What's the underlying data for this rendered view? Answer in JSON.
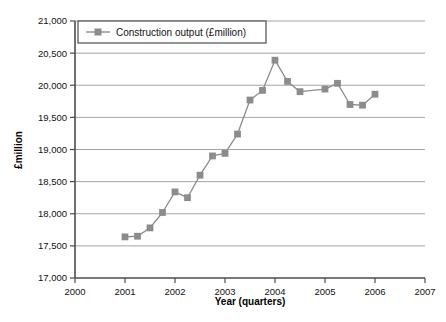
{
  "chart_data": {
    "type": "line",
    "title": "",
    "subtitle": "",
    "xlabel": "Year (quarters)",
    "ylabel": "£million",
    "xlim": [
      2000,
      2007
    ],
    "ylim": [
      17000,
      21000
    ],
    "grid": true,
    "grid_axis": "y",
    "legend_position": "top-left-inside",
    "series": [
      {
        "name": "Construction output (£million)",
        "color": "#8c8c8c",
        "marker": "square",
        "x": [
          2001.0,
          2001.25,
          2001.5,
          2001.75,
          2002.0,
          2002.25,
          2002.5,
          2002.75,
          2003.0,
          2003.25,
          2003.5,
          2003.75,
          2004.0,
          2004.25,
          2004.5,
          2005.0,
          2005.25,
          2005.5,
          2005.75,
          2006.0
        ],
        "values": [
          17640,
          17650,
          17780,
          18020,
          18340,
          18250,
          18600,
          18900,
          18940,
          19240,
          19770,
          19920,
          20390,
          20060,
          19900,
          19940,
          20030,
          19700,
          19690,
          19860
        ]
      }
    ],
    "x_ticks": [
      2000,
      2001,
      2002,
      2003,
      2004,
      2005,
      2006,
      2007
    ],
    "x_tick_labels": [
      "2000",
      "2001",
      "2002",
      "2003",
      "2004",
      "2005",
      "2006",
      "2007"
    ],
    "y_ticks": [
      17000,
      17500,
      18000,
      18500,
      19000,
      19500,
      20000,
      20500,
      21000
    ],
    "y_tick_labels": [
      "17,000",
      "17,500",
      "18,000",
      "18,500",
      "19,000",
      "19,500",
      "20,000",
      "20,500",
      "21,000"
    ]
  },
  "legend": {
    "entries": [
      {
        "label": "Construction output (£million)"
      }
    ]
  },
  "axes": {
    "y_title": "£million",
    "x_title": "Year (quarters)"
  },
  "colors": {
    "series": "#8c8c8c",
    "axis": "#4d4d4d",
    "grid": "#9a9a9a",
    "text": "#111111",
    "background": "#ffffff",
    "legend_border": "#4d4d4d"
  }
}
